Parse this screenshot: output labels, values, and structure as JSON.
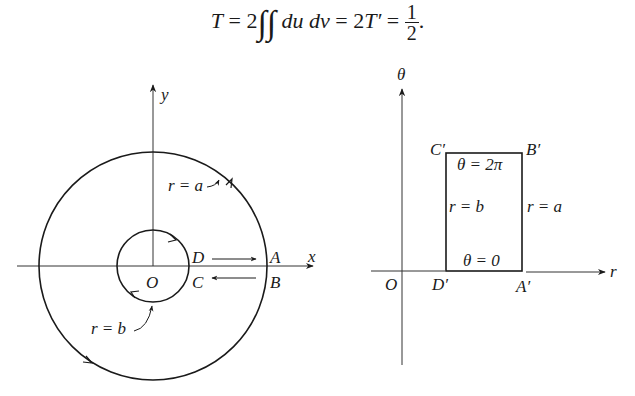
{
  "formula": {
    "lhs": "T",
    "eq1": " = 2",
    "integrand": "du dv",
    "eq2": " = 2",
    "mid": "T′",
    "eq3": " = ",
    "frac_num": "1",
    "frac_den": "2",
    "end": "."
  },
  "left_figure": {
    "x_axis_label": "x",
    "y_axis_label": "y",
    "origin_label": "O",
    "outer_circle_label": "r = a",
    "inner_circle_label": "r = b",
    "point_labels": {
      "A": "A",
      "B": "B",
      "C": "C",
      "D": "D"
    }
  },
  "right_figure": {
    "vertical_axis_label": "θ",
    "horizontal_axis_label": "r",
    "origin_label": "O",
    "corner_labels": {
      "A": "A′",
      "B": "B′",
      "C": "C′",
      "D": "D′"
    },
    "top_edge_label": "θ = 2π",
    "bottom_edge_label": "θ = 0",
    "left_edge_label": "r = b",
    "right_edge_label": "r = a"
  }
}
